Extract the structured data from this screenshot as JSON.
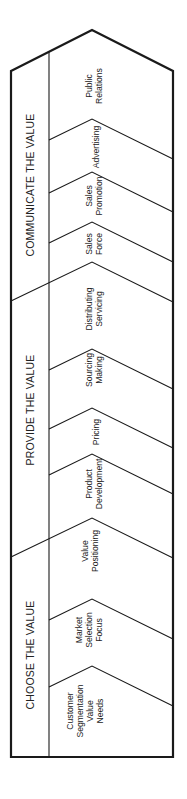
{
  "diagram": {
    "type": "value-delivery-sequence",
    "orientation": "rotated-90-ccw",
    "phases": [
      {
        "title": "CHOOSE THE VALUE",
        "steps": [
          {
            "lines": [
              "Customer",
              "Segmentation",
              "Value",
              "Needs"
            ]
          },
          {
            "lines": [
              "Market",
              "Selection",
              "Focus"
            ]
          },
          {
            "lines": [
              "Value",
              "Positioning"
            ]
          }
        ]
      },
      {
        "title": "PROVIDE THE VALUE",
        "steps": [
          {
            "lines": [
              "Product",
              "Development"
            ]
          },
          {
            "lines": [
              "Pricing"
            ]
          },
          {
            "lines": [
              "Sourcing",
              "Making"
            ]
          },
          {
            "lines": [
              "Distributing",
              "Servicing"
            ]
          }
        ]
      },
      {
        "title": "COMMUNICATE THE VALUE",
        "steps": [
          {
            "lines": [
              "Sales",
              "Force"
            ]
          },
          {
            "lines": [
              "Sales",
              "Promotion"
            ]
          },
          {
            "lines": [
              "Advertising"
            ]
          },
          {
            "lines": [
              "Public",
              "Relations"
            ]
          }
        ]
      }
    ]
  },
  "colors": {
    "stroke": "#1a1a1a",
    "background": "#ffffff",
    "text": "#222222"
  }
}
